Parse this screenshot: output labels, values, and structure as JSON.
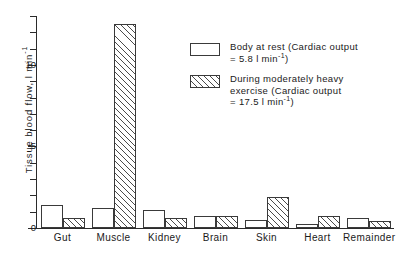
{
  "chart_data": {
    "type": "bar",
    "title": "",
    "xlabel": "",
    "ylabel": "Tissue blood flow, l min",
    "ylabel_exponent": "-1",
    "ylim": [
      0,
      13
    ],
    "ytick_values": [
      0,
      5,
      10
    ],
    "ytick_labels": [
      "0",
      "5",
      "10"
    ],
    "yminor_step": 1,
    "grid": false,
    "legend_position": "upper right",
    "categories": [
      "Gut",
      "Muscle",
      "Kidney",
      "Brain",
      "Skin",
      "Heart",
      "Remainder"
    ],
    "series": [
      {
        "name": "Body at rest (Cardiac output = 5.8 l min-1)",
        "fill": "white",
        "values": [
          1.4,
          1.2,
          1.1,
          0.75,
          0.5,
          0.25,
          0.6
        ]
      },
      {
        "name": "During moderately heavy exercise (Cardiac output = 17.5 l min-1)",
        "fill": "hatched",
        "values": [
          0.6,
          12.5,
          0.6,
          0.75,
          1.9,
          0.75,
          0.4
        ]
      }
    ]
  },
  "y_axis": {
    "label_main": "Tissue blood flow, l min",
    "label_sup": "-1",
    "ticks": [
      "10",
      "5",
      "0"
    ]
  },
  "x_axis": {
    "labels": [
      "Gut",
      "Muscle",
      "Kidney",
      "Brain",
      "Skin",
      "Heart",
      "Remainder"
    ]
  },
  "legend": {
    "rest": {
      "line1": "Body at rest (Cardiac output",
      "line2_pre": "= 5.8  l min",
      "line2_sup": "-1",
      "line2_post": ")"
    },
    "exercise": {
      "line1": "During moderately heavy",
      "line2": "exercise (Cardiac output",
      "line3_pre": "= 17.5  l min",
      "line3_sup": "-1",
      "line3_post": ")"
    }
  },
  "colors": {
    "axis": "#2b2b2b",
    "bar_outline": "#3a3a3a",
    "hatch": "#4a4a4a",
    "background": "#ffffff"
  }
}
